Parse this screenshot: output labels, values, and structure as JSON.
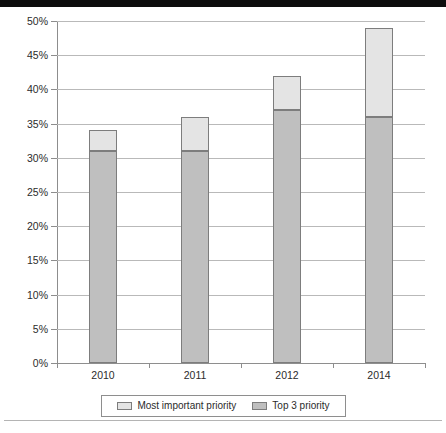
{
  "chart_data": {
    "type": "bar",
    "title": "",
    "subtitle": "",
    "xlabel": "",
    "ylabel": "",
    "stacked": true,
    "grid": true,
    "legend_position": "bottom",
    "categories": [
      "2010",
      "2011",
      "2012",
      "2014"
    ],
    "ylim": [
      0,
      50
    ],
    "ytick_step": 5,
    "ytick_labels": [
      "50%",
      "45%",
      "40%",
      "35%",
      "30%",
      "25%",
      "20%",
      "15%",
      "10%",
      "5%",
      "0%"
    ],
    "ytick_values": [
      50,
      45,
      40,
      35,
      30,
      25,
      20,
      15,
      10,
      5,
      0
    ],
    "series": [
      {
        "name": "Top 3 priority",
        "color": "#bfbfbf",
        "values": [
          31,
          31,
          37,
          36
        ]
      },
      {
        "name": "Most important priority",
        "color": "#e4e4e4",
        "values": [
          3,
          5,
          5,
          13
        ]
      }
    ],
    "stack_totals": [
      34,
      36,
      42,
      49
    ]
  },
  "legend": {
    "entries": [
      {
        "label": "Most important priority",
        "swatch": "light"
      },
      {
        "label": "Top 3 priority",
        "swatch": "dark"
      }
    ]
  },
  "colors": {
    "most_important_priority": "#e4e4e4",
    "top_3_priority": "#bfbfbf",
    "gridline": "#b9b9b9",
    "axis": "#8d8d8d",
    "bar_outline": "#7d7d7d",
    "text": "#2b2b2b"
  }
}
